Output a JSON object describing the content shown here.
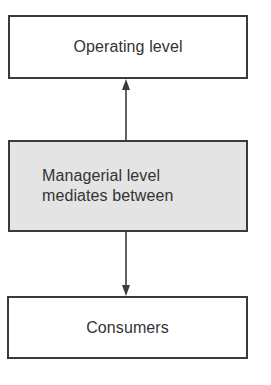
{
  "diagram": {
    "type": "vertical-flow",
    "nodes": [
      {
        "id": "operating",
        "label": "Operating level",
        "fill": "#ffffff"
      },
      {
        "id": "managerial",
        "label_lines": [
          "Managerial level",
          "mediates between"
        ],
        "fill": "#e4e4e4"
      },
      {
        "id": "consumers",
        "label": "Consumers",
        "fill": "#ffffff"
      }
    ],
    "edges": [
      {
        "from": "managerial",
        "to": "operating",
        "direction": "up"
      },
      {
        "from": "managerial",
        "to": "consumers",
        "direction": "down"
      }
    ],
    "colors": {
      "stroke": "#3a3a3a",
      "text": "#333333",
      "highlight_fill": "#e4e4e4"
    }
  }
}
